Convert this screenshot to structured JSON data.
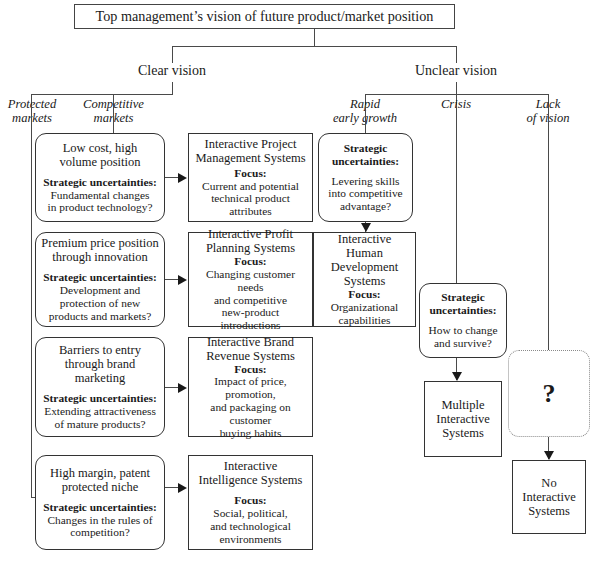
{
  "diagram": {
    "title": "Top management’s vision of future product/market position",
    "branches": {
      "left": "Clear vision",
      "right": "Unclear vision"
    },
    "sub_branches": {
      "protected": "Protected\nmarkets",
      "protected_l1": "Protected",
      "protected_l2": "markets",
      "competitive_l1": "Competitive",
      "competitive_l2": "markets",
      "rapid_l1": "Rapid",
      "rapid_l2": "early growth",
      "crisis": "Crisis",
      "lack_l1": "Lack",
      "lack_l2": "of vision"
    },
    "labels": {
      "strategic_uncertainties": "Strategic uncertainties:",
      "strategic_l1": "Strategic",
      "strategic_l2": "uncertainties:",
      "focus": "Focus:"
    },
    "rows": [
      {
        "left": {
          "title_l1": "Low cost, high",
          "title_l2": "volume position",
          "body_l1": "Fundamental changes",
          "body_l2": "in product technology?"
        },
        "right": {
          "title_l1": "Interactive Project",
          "title_l2": "Management Systems",
          "body_l1": "Current and potential",
          "body_l2": "technical product attributes"
        }
      },
      {
        "left": {
          "title_l1": "Premium price position",
          "title_l2": "through innovation",
          "body_l1": "Development and",
          "body_l2": "protection of new",
          "body_l3": "products and markets?"
        },
        "right": {
          "title_l1": "Interactive Profit",
          "title_l2": "Planning Systems",
          "body_l1": "Changing customer needs",
          "body_l2": "and competitive",
          "body_l3": "new-product introductions"
        }
      },
      {
        "left": {
          "title_l1": "Barriers to entry",
          "title_l2": "through brand",
          "title_l3": "marketing",
          "body_l1": "Extending attractiveness",
          "body_l2": "of mature products?"
        },
        "right": {
          "title_l1": "Interactive Brand",
          "title_l2": "Revenue Systems",
          "body_l1": "Impact of price, promotion,",
          "body_l2": "and packaging on customer",
          "body_l3": "buying habits"
        }
      },
      {
        "left": {
          "title_l1": "High margin, patent",
          "title_l2": "protected niche",
          "body_l1": "Changes in the rules of",
          "body_l2": "competition?"
        },
        "right": {
          "title_l1": "Interactive",
          "title_l2": "Intelligence Systems",
          "body_l1": "Social, political,",
          "body_l2": "and technological",
          "body_l3": "environments"
        }
      }
    ],
    "rapid_column": {
      "uncertainty_box": {
        "body_l1": "Levering skills",
        "body_l2": "into competitive",
        "body_l3": "advantage?"
      },
      "system_box": {
        "title_l1": "Interactive Human",
        "title_l2": "Development",
        "title_l3": "Systems",
        "body_l1": "Organizational",
        "body_l2": "capabilities"
      }
    },
    "crisis_column": {
      "uncertainty_box": {
        "body_l1": "How to change",
        "body_l2": "and survive?"
      },
      "system_box": {
        "title_l1": "Multiple",
        "title_l2": "Interactive",
        "title_l3": "Systems"
      }
    },
    "lack_column": {
      "question_box": {
        "mark": "?"
      },
      "system_box": {
        "title_l1": "No",
        "title_l2": "Interactive",
        "title_l3": "Systems"
      }
    }
  }
}
